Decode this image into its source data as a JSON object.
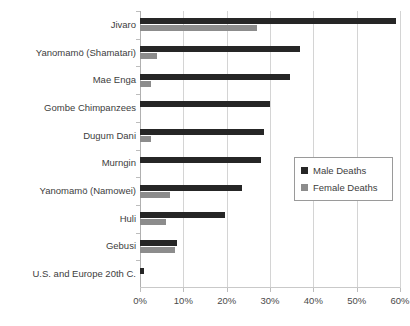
{
  "chart_data": {
    "type": "bar",
    "orientation": "horizontal",
    "title": "",
    "xlabel": "",
    "ylabel": "",
    "xlim": [
      0,
      0.6
    ],
    "xticks": [
      "0%",
      "10%",
      "20%",
      "30%",
      "40%",
      "50%",
      "60%"
    ],
    "xtick_values": [
      0,
      10,
      20,
      30,
      40,
      50,
      60
    ],
    "grid": true,
    "legend_position": "center-right",
    "categories": [
      "Jivaro",
      "Yanomamö (Shamatari)",
      "Mae Enga",
      "Gombe Chimpanzees",
      "Dugum Dani",
      "Murngin",
      "Yanomamö (Namowei)",
      "Huli",
      "Gebusi",
      "U.S. and Europe 20th C."
    ],
    "series": [
      {
        "name": "Male Deaths",
        "color": "#262626",
        "values": [
          59,
          37,
          34.5,
          30,
          28.5,
          28,
          23.5,
          19.5,
          8.5,
          1
        ]
      },
      {
        "name": "Female Deaths",
        "color": "#8c8c8c",
        "values": [
          27,
          4,
          2.5,
          0,
          2.5,
          0,
          7,
          6,
          8,
          0
        ]
      }
    ]
  },
  "legend": {
    "items": [
      {
        "label": "Male Deaths",
        "color": "#262626"
      },
      {
        "label": "Female Deaths",
        "color": "#8c8c8c"
      }
    ]
  }
}
